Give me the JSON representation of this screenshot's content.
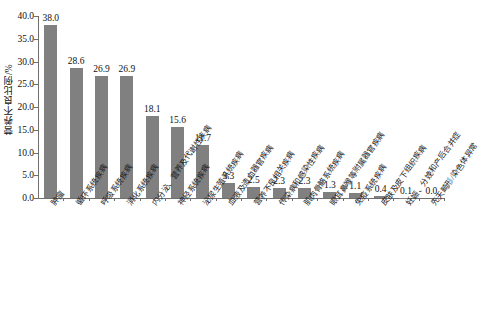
{
  "chart_data": {
    "type": "bar",
    "title": "",
    "xlabel": "",
    "ylabel": "营养不良比例/%",
    "ylim": [
      0.0,
      40.0
    ],
    "yticks": [
      "0.0",
      "5.0",
      "10.0",
      "15.0",
      "20.0",
      "25.0",
      "30.0",
      "35.0",
      "40.0"
    ],
    "ytick_values": [
      0.0,
      5.0,
      10.0,
      15.0,
      20.0,
      25.0,
      30.0,
      35.0,
      40.0
    ],
    "grid": false,
    "legend": null,
    "bar_color": "#808080",
    "axis_color": "#6f6f6f",
    "categories": [
      "肿瘤",
      "循环系统疾病",
      "呼吸系统疾病",
      "消化系统疾病",
      "内分泌、营养及代谢性疾病",
      "神经系统疾病",
      "泌尿生殖系统疾病",
      "血液及造血器官疾病",
      "营养不良相关疾病",
      "传染病和感染性疾病",
      "肌肉骨骼系统疾病",
      "眼耳鼻喉等附属器官疾病",
      "免疫系统疾病",
      "皮肤及皮下组织疾病",
      "妊娠、分娩和产后合并症",
      "先天畸形/染色体异常"
    ],
    "values": [
      38.0,
      28.6,
      26.9,
      26.9,
      18.1,
      15.6,
      11.7,
      3.3,
      2.5,
      2.3,
      2.3,
      1.3,
      1.1,
      0.4,
      0.1,
      0.0
    ],
    "value_labels": [
      "38.0",
      "28.6",
      "26.9",
      "26.9",
      "18.1",
      "15.6",
      "11.7",
      "3.3",
      "2.5",
      "2.3",
      "2.3",
      "1.3",
      "1.1",
      "0.4",
      "0.1",
      "0.0"
    ]
  }
}
